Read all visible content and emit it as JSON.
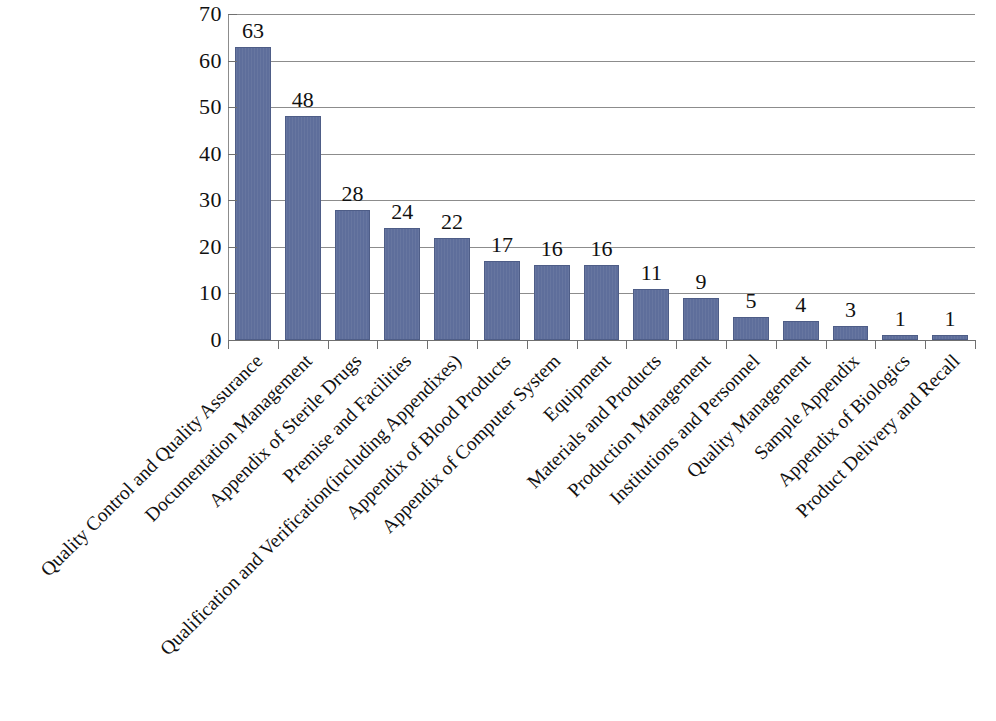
{
  "chart_data": {
    "type": "bar",
    "title": "",
    "subtitle": "",
    "xlabel": "",
    "ylabel": "",
    "ylim": [
      0,
      70
    ],
    "ytick_step": 10,
    "yticks": [
      0,
      10,
      20,
      30,
      40,
      50,
      60,
      70
    ],
    "grid": true,
    "grid_axis": "y",
    "legend": false,
    "legend_position": "none",
    "bar_color": "#5e6e9b",
    "bar_edge_color": "#4e5d87",
    "grid_color": "#8c8c8c",
    "axis_color": "#6f6f6f",
    "text_color": "#111111",
    "data_labels": true,
    "categories": [
      "Quality Control and Quality Assurance",
      "Documentation Management",
      "Appendix of Sterile Drugs",
      "Premise and Facilities",
      "Qualification and Verification(including Appendixes)",
      "Appendix of Blood Products",
      "Appendix of Computer System",
      "Equipment",
      "Materials and Products",
      "Production Management",
      "Institutions and Personnel",
      "Quality Management",
      "Sample Appendix",
      "Appendix of Biologics",
      "Product Delivery and Recall"
    ],
    "values": [
      63,
      48,
      28,
      24,
      22,
      17,
      16,
      16,
      11,
      9,
      5,
      4,
      3,
      1,
      1
    ],
    "value_labels": [
      "63",
      "48",
      "28",
      "24",
      "22",
      "17",
      "16",
      "16",
      "11",
      "9",
      "5",
      "4",
      "3",
      "1",
      "1"
    ],
    "ytick_labels": [
      "0",
      "10",
      "20",
      "30",
      "40",
      "50",
      "60",
      "70"
    ]
  }
}
